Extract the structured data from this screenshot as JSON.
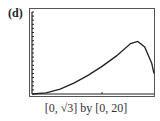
{
  "panel_label": "(d)",
  "caption": "[0, √3] by [0, 20]",
  "chart_data": {
    "type": "line",
    "title": "",
    "xlabel": "",
    "ylabel": "",
    "window": "[0, √3] by [0, 20]",
    "xlim": [
      0,
      1.732
    ],
    "ylim": [
      0,
      20
    ],
    "grid": false,
    "y_ticks_count": 20,
    "x_ticks": [
      0.866
    ],
    "series": [
      {
        "name": "curve",
        "x": [
          0,
          0.2,
          0.4,
          0.6,
          0.8,
          1.0,
          1.2,
          1.4,
          1.5,
          1.6,
          1.7,
          1.732
        ],
        "y": [
          0,
          0.3,
          1.2,
          2.7,
          4.6,
          6.8,
          9.3,
          12.3,
          12.8,
          11.5,
          7.5,
          5.0
        ]
      }
    ]
  }
}
